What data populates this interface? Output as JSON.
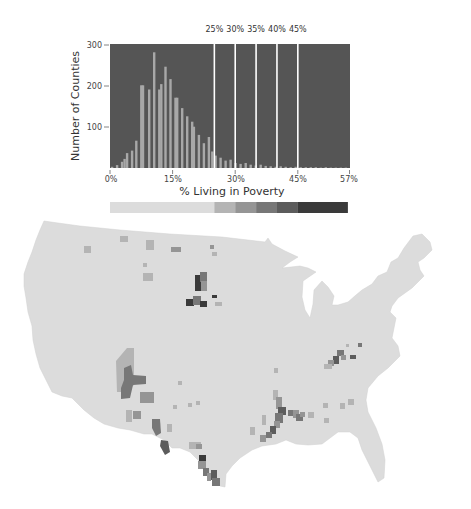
{
  "chart_data": [
    {
      "type": "bar",
      "title": "",
      "xlabel": "% Living in Poverty",
      "ylabel": "Number of Counties",
      "ylim": [
        0,
        300
      ],
      "xlim": [
        0,
        57
      ],
      "yticks": [
        100,
        200,
        300
      ],
      "xticks": [
        "0%",
        "15%",
        "30%",
        "45%",
        "57%"
      ],
      "xtick_values": [
        0,
        15,
        30,
        45,
        57
      ],
      "grid": false,
      "background": "#555555",
      "bar_color": "#a8a8a8",
      "bar_width_pct": 0.6,
      "x": [
        0.5,
        1.7,
        2.9,
        3.5,
        4.1,
        5.3,
        6.3,
        7.5,
        7.9,
        9.4,
        10.6,
        11.8,
        12.3,
        13.3,
        14.5,
        15.7,
        16.1,
        17.3,
        18.5,
        19.7,
        20.1,
        21.3,
        22.5,
        23.7,
        24.5,
        25.3,
        26.5,
        27.7,
        28.9,
        30.1,
        31.3,
        32.5,
        33.7,
        34.9,
        36.1,
        37.3,
        38.5,
        39.7,
        40.9,
        42.1,
        43.3,
        44.5,
        45.7,
        46.9,
        48.1,
        49.3,
        50.5,
        51.7,
        52.9,
        54.1,
        55.3,
        56.5
      ],
      "values": [
        3,
        7,
        15,
        22,
        36,
        42,
        66,
        200,
        200,
        190,
        280,
        190,
        203,
        245,
        215,
        170,
        170,
        145,
        125,
        112,
        100,
        80,
        60,
        75,
        40,
        30,
        25,
        18,
        20,
        12,
        10,
        12,
        8,
        6,
        8,
        5,
        4,
        3,
        4,
        3,
        2,
        3,
        2,
        2,
        2,
        2,
        1,
        2,
        1,
        1,
        1,
        1
      ],
      "thresholds": [
        {
          "label": "25%",
          "value": 25
        },
        {
          "label": "30%",
          "value": 30
        },
        {
          "label": "35%",
          "value": 35
        },
        {
          "label": "40%",
          "value": 40
        },
        {
          "label": "45%",
          "value": 45
        }
      ],
      "legend": {
        "type": "color-scale",
        "bins": [
          {
            "range": [
              0,
              25
            ],
            "color": "#dcdcdc"
          },
          {
            "range": [
              25,
              30
            ],
            "color": "#b4b4b4"
          },
          {
            "range": [
              30,
              35
            ],
            "color": "#959595"
          },
          {
            "range": [
              35,
              40
            ],
            "color": "#777777"
          },
          {
            "range": [
              40,
              45
            ],
            "color": "#5c5c5c"
          },
          {
            "range": [
              45,
              57
            ],
            "color": "#3a3a3a"
          }
        ]
      }
    },
    {
      "type": "choropleth",
      "title": "",
      "region": "Contiguous United States, counties",
      "base_color": "#dcdcdc",
      "highlighted_regions": [
        {
          "name": "Dakotas reservations",
          "level": 5
        },
        {
          "name": "Four Corners / Navajo",
          "level": 3
        },
        {
          "name": "Texas border",
          "level": 4
        },
        {
          "name": "Mississippi Delta",
          "level": 4
        },
        {
          "name": "Alabama Black Belt",
          "level": 3
        },
        {
          "name": "Appalachian Kentucky",
          "level": 4
        }
      ]
    }
  ],
  "labels": {
    "ylabel": "Number of Counties",
    "xlabel": "% Living in Poverty",
    "yticks": [
      "100",
      "200",
      "300"
    ],
    "xticks": [
      "0%",
      "15%",
      "30%",
      "45%",
      "57%"
    ],
    "thresholds": [
      "25%",
      "30%",
      "35%",
      "40%",
      "45%"
    ]
  }
}
